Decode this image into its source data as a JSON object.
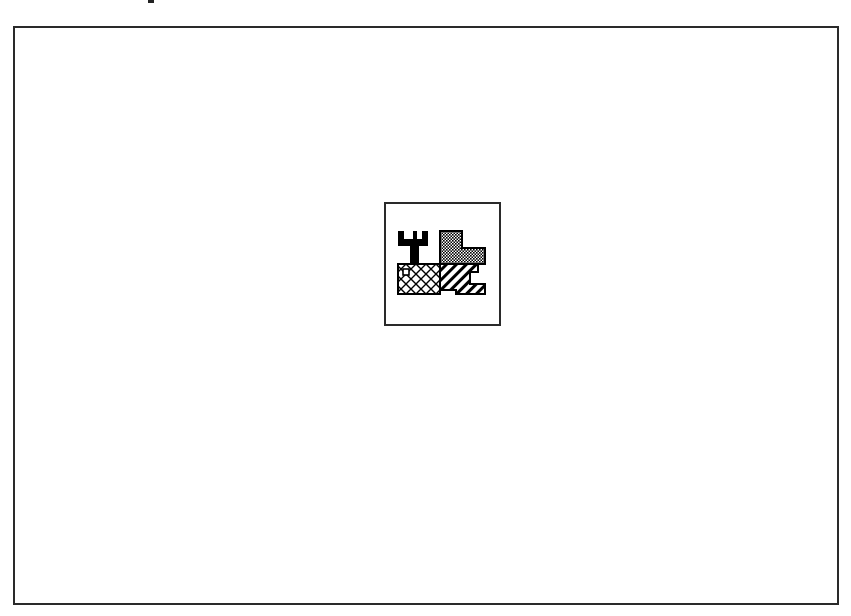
{
  "canvas": {
    "frame": {
      "stroke": "#2a2a2a",
      "fill": "#ffffff"
    }
  },
  "icon": {
    "name": "map-regions-icon",
    "description": "Four-region patterned map tile",
    "regions": [
      {
        "name": "solid-black-region",
        "pattern": "solid",
        "color": "#000000"
      },
      {
        "name": "dotted-region",
        "pattern": "dots",
        "color": "#000000"
      },
      {
        "name": "crosshatch-region",
        "pattern": "crosshatch",
        "color": "#000000"
      },
      {
        "name": "diagonal-hatch-region",
        "pattern": "diagonal",
        "color": "#000000"
      }
    ]
  }
}
